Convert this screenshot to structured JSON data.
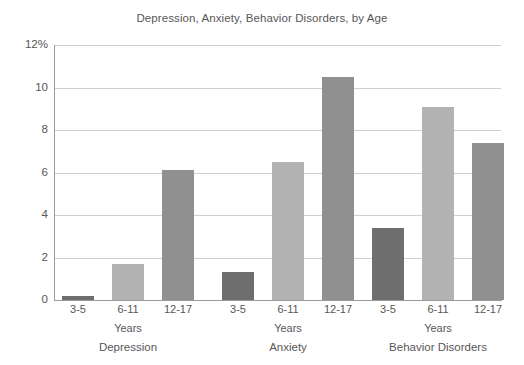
{
  "chart_data": {
    "type": "bar",
    "title": "Depression, Anxiety, Behavior Disorders, by Age",
    "xlabel": "",
    "ylabel": "",
    "ylim": [
      0,
      12
    ],
    "yticks": [
      "0",
      "2",
      "4",
      "6",
      "8",
      "10",
      "12%"
    ],
    "ytick_values": [
      0,
      2,
      4,
      6,
      8,
      10,
      12
    ],
    "grid": "horizontal",
    "legend": "none",
    "categories": [
      "3-5",
      "6-11",
      "12-17"
    ],
    "category_axis_label": "Years",
    "groups": [
      {
        "name": "Depression",
        "sub_label": "Years",
        "bars": [
          {
            "category": "3-5",
            "value": 0.2,
            "color": "#6e6e6e"
          },
          {
            "category": "6-11",
            "value": 1.7,
            "color": "#b2b2b2"
          },
          {
            "category": "12-17",
            "value": 6.1,
            "color": "#909090"
          }
        ]
      },
      {
        "name": "Anxiety",
        "sub_label": "Years",
        "bars": [
          {
            "category": "3-5",
            "value": 1.3,
            "color": "#6e6e6e"
          },
          {
            "category": "6-11",
            "value": 6.5,
            "color": "#b2b2b2"
          },
          {
            "category": "12-17",
            "value": 10.5,
            "color": "#909090"
          }
        ]
      },
      {
        "name": "Behavior Disorders",
        "sub_label": "Years",
        "bars": [
          {
            "category": "3-5",
            "value": 3.4,
            "color": "#6e6e6e"
          },
          {
            "category": "6-11",
            "value": 9.1,
            "color": "#b2b2b2"
          },
          {
            "category": "12-17",
            "value": 7.4,
            "color": "#909090"
          }
        ]
      }
    ],
    "colors": {
      "age_3_5": "#6e6e6e",
      "age_6_11": "#b2b2b2",
      "age_12_17": "#909090",
      "gridline": "#cfcfcf",
      "axis": "#9a9a9a",
      "text": "#575757",
      "background": "#ffffff"
    }
  }
}
